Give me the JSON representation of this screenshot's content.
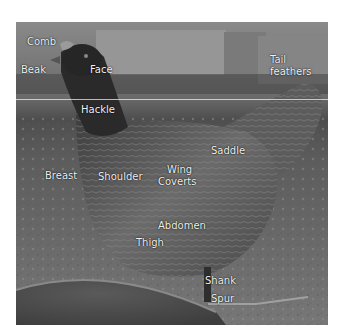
{
  "figure": {
    "colors": {
      "background": "#ffffff",
      "label_text": "#f2f2f2",
      "guide_line": "#e6e6e6"
    },
    "labels": [
      {
        "id": "comb",
        "text": "Comb",
        "x": 27,
        "y": 36
      },
      {
        "id": "beak",
        "text": "Beak",
        "x": 21,
        "y": 64
      },
      {
        "id": "face",
        "text": "Face",
        "x": 90,
        "y": 64
      },
      {
        "id": "tail-feathers",
        "line1": "Tail",
        "line2": "feathers",
        "x": 270,
        "y": 54
      },
      {
        "id": "hackle",
        "text": "Hackle",
        "x": 81,
        "y": 104
      },
      {
        "id": "saddle",
        "text": "Saddle",
        "x": 211,
        "y": 145
      },
      {
        "id": "breast",
        "text": "Breast",
        "x": 45,
        "y": 170
      },
      {
        "id": "shoulder",
        "text": "Shoulder",
        "x": 98,
        "y": 171
      },
      {
        "id": "wing-coverts",
        "line1": "Wing",
        "line2": "Coverts",
        "x": 158,
        "y": 164
      },
      {
        "id": "abdomen",
        "text": "Abdomen",
        "x": 158,
        "y": 220
      },
      {
        "id": "thigh",
        "text": "Thigh",
        "x": 136,
        "y": 237
      },
      {
        "id": "shank",
        "text": "Shank",
        "x": 205,
        "y": 275
      },
      {
        "id": "spur",
        "text": "Spur",
        "x": 211,
        "y": 293
      }
    ]
  }
}
